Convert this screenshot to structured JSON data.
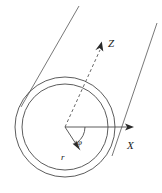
{
  "figure": {
    "background_color": "#ffffff",
    "line_color": "#4a4a4a",
    "text_color": "#1a1a1a"
  },
  "labels": {
    "z_axis": "Z",
    "x_axis": "X",
    "angle_phi": "φ",
    "radius_r": "r"
  },
  "geometry": {
    "center": {
      "x": 65,
      "y": 127
    },
    "outer_circle_radius": 50,
    "inner_circle_radius": 43,
    "x_axis_end": {
      "x": 133,
      "y": 127
    },
    "z_axis_end": {
      "x": 101,
      "y": 42
    },
    "radius_vector_end": {
      "x": 80,
      "y": 150
    },
    "phi_label_pos": {
      "x": 79,
      "y": 142
    },
    "r_label_pos": {
      "x": 64,
      "y": 157
    }
  },
  "elements": [
    {
      "name": "outer-tube-circle",
      "kind": "ellipse"
    },
    {
      "name": "inner-tube-circle",
      "kind": "ellipse"
    },
    {
      "name": "tube-generator-line-left",
      "kind": "line"
    },
    {
      "name": "tube-generator-line-right",
      "kind": "line"
    },
    {
      "name": "z-axis-dashed-line",
      "kind": "dashed-line-with-arrow"
    },
    {
      "name": "x-axis-line",
      "kind": "line-with-arrow"
    },
    {
      "name": "radius-vector",
      "kind": "line-with-arrow"
    },
    {
      "name": "angle-arc",
      "kind": "arc"
    }
  ]
}
